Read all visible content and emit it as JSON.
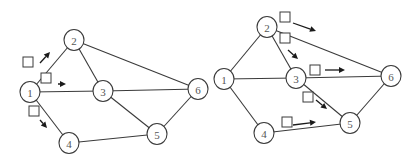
{
  "diagrams": [
    {
      "name": "left-graph",
      "nodes": [
        {
          "id": "1",
          "label": "1",
          "x": 30,
          "y": 92
        },
        {
          "id": "2",
          "label": "2",
          "x": 74,
          "y": 40
        },
        {
          "id": "3",
          "label": "3",
          "x": 103,
          "y": 91
        },
        {
          "id": "4",
          "label": "4",
          "x": 69,
          "y": 143
        },
        {
          "id": "5",
          "label": "5",
          "x": 157,
          "y": 134
        },
        {
          "id": "6",
          "label": "6",
          "x": 198,
          "y": 89
        }
      ],
      "edges": [
        [
          "1",
          "2"
        ],
        [
          "1",
          "3"
        ],
        [
          "1",
          "4"
        ],
        [
          "2",
          "3"
        ],
        [
          "2",
          "6"
        ],
        [
          "3",
          "6"
        ],
        [
          "3",
          "5"
        ],
        [
          "4",
          "5"
        ],
        [
          "5",
          "6"
        ]
      ],
      "flow_markers": [
        {
          "box": [
            28,
            62
          ],
          "arrow_from": [
            40,
            63
          ],
          "arrow_to": [
            50,
            52
          ]
        },
        {
          "box": [
            46,
            78
          ],
          "arrow_from": [
            58,
            84
          ],
          "arrow_to": [
            66,
            84
          ]
        },
        {
          "box": [
            34,
            111
          ],
          "arrow_from": [
            40,
            120
          ],
          "arrow_to": [
            47,
            128
          ]
        }
      ]
    },
    {
      "name": "right-graph",
      "nodes": [
        {
          "id": "1",
          "label": "1",
          "x": 224,
          "y": 79
        },
        {
          "id": "2",
          "label": "2",
          "x": 267,
          "y": 27
        },
        {
          "id": "3",
          "label": "3",
          "x": 296,
          "y": 78
        },
        {
          "id": "4",
          "label": "4",
          "x": 264,
          "y": 133
        },
        {
          "id": "5",
          "label": "5",
          "x": 350,
          "y": 123
        },
        {
          "id": "6",
          "label": "6",
          "x": 391,
          "y": 76
        }
      ],
      "edges": [
        [
          "1",
          "2"
        ],
        [
          "1",
          "3"
        ],
        [
          "1",
          "4"
        ],
        [
          "2",
          "3"
        ],
        [
          "2",
          "6"
        ],
        [
          "3",
          "6"
        ],
        [
          "3",
          "5"
        ],
        [
          "4",
          "5"
        ],
        [
          "5",
          "6"
        ]
      ],
      "flow_markers": [
        {
          "box": [
            285,
            17
          ],
          "arrow_from": [
            293,
            23
          ],
          "arrow_to": [
            316,
            31
          ]
        },
        {
          "box": [
            285,
            38
          ],
          "arrow_from": [
            288,
            50
          ],
          "arrow_to": [
            298,
            59
          ]
        },
        {
          "box": [
            315,
            70
          ],
          "arrow_from": [
            325,
            70
          ],
          "arrow_to": [
            345,
            70
          ]
        },
        {
          "box": [
            308,
            97
          ],
          "arrow_from": [
            316,
            100
          ],
          "arrow_to": [
            327,
            109
          ]
        },
        {
          "box": [
            287,
            122
          ],
          "arrow_from": [
            293,
            125
          ],
          "arrow_to": [
            316,
            122
          ]
        }
      ]
    }
  ],
  "style": {
    "edge_color": "#3a3a3a",
    "arrow_color": "#1a1a1a",
    "label_color": "#555555",
    "background": "#ffffff"
  }
}
